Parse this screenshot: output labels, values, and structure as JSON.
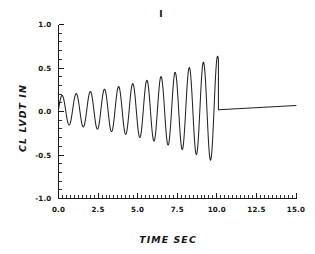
{
  "chart_data": {
    "type": "line",
    "title": "I",
    "xlabel": "TIME   SEC",
    "ylabel": "CL LVDT   IN",
    "xlim": [
      0.0,
      15.0
    ],
    "ylim": [
      -1.0,
      1.0
    ],
    "grid": false,
    "legend": false,
    "x_ticks": [
      "0.0",
      "2.5",
      "5.0",
      "7.5",
      "10.0",
      "12.5",
      "15.0"
    ],
    "x_tick_values": [
      0.0,
      2.5,
      5.0,
      7.5,
      10.0,
      12.5,
      15.0
    ],
    "x_minor_step": 0.25,
    "y_ticks": [
      "1.0",
      "0.5",
      "0.0",
      "-0.5",
      "-1.0"
    ],
    "y_tick_values": [
      1.0,
      0.5,
      0.0,
      -0.5,
      -1.0
    ],
    "y_minor_step": 0.1,
    "series": [
      {
        "name": "CL LVDT response",
        "description": "Divergent (growing amplitude) oscillation from t=0 to t=10.1 s, then flat near zero out to t=15 s",
        "oscillation": {
          "t_start": 0.0,
          "t_end": 10.1,
          "frequency_hz": 1.12,
          "growth": "exponential envelope",
          "amp_start": 0.16,
          "amp_end": 0.62,
          "offset": 0.02
        },
        "tail": {
          "t_start": 10.1,
          "t_end": 15.0,
          "y_start": 0.02,
          "y_end": 0.07
        },
        "peaks_t": [
          0.45,
          1.34,
          2.23,
          3.13,
          4.02,
          4.91,
          5.8,
          6.7,
          7.59,
          8.48,
          9.38
        ],
        "peaks_y": [
          0.16,
          0.19,
          0.23,
          0.28,
          0.33,
          0.38,
          0.43,
          0.47,
          0.52,
          0.56,
          0.6
        ],
        "troughs_t": [
          0.9,
          1.79,
          2.68,
          3.57,
          4.47,
          5.36,
          6.25,
          7.14,
          8.04,
          8.93,
          9.82
        ],
        "troughs_y": [
          -0.13,
          -0.16,
          -0.2,
          -0.25,
          -0.3,
          -0.35,
          -0.4,
          -0.44,
          -0.49,
          -0.53,
          -0.58
        ]
      }
    ]
  },
  "figure": {
    "background_color": "#ffffff",
    "line_color": "#222222",
    "axis_color": "#1a1a1a"
  }
}
